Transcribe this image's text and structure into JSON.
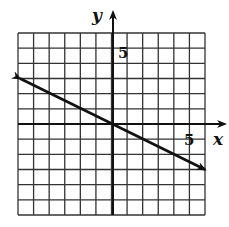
{
  "chart_data": {
    "type": "line",
    "title": "",
    "xlabel": "x",
    "ylabel": "y",
    "xlim": [
      -6,
      6
    ],
    "ylim": [
      -6,
      6
    ],
    "grid": true,
    "grid_step": 1,
    "tick_labels": {
      "x": [
        "5"
      ],
      "y": [
        "5"
      ]
    },
    "series": [
      {
        "name": "line",
        "equation": "y = -x/2",
        "x": [
          -6,
          0,
          6
        ],
        "y": [
          3,
          0,
          -3
        ],
        "arrows_both_ends": true
      }
    ]
  },
  "labels": {
    "x_axis": "x",
    "y_axis": "y",
    "x_tick": "5",
    "y_tick": "5"
  }
}
